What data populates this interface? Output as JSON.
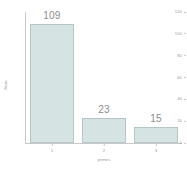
{
  "chart_data": {
    "type": "bar",
    "title": "",
    "categories": [
      "1",
      "2",
      "3"
    ],
    "values": [
      109,
      23,
      15
    ],
    "bar_labels": [
      "109",
      "23",
      "15"
    ],
    "xlabel": "primes",
    "ylabel": "Num",
    "ylim": [
      0,
      120
    ],
    "yticks": [
      0,
      20,
      40,
      60,
      80,
      100,
      120
    ],
    "ytick_labels": [
      "0",
      "20",
      "40",
      "60",
      "80",
      "100",
      "120"
    ],
    "xtick_labels": [
      "1",
      "2",
      "3"
    ],
    "grid": false,
    "legend": false,
    "legend_position": "none",
    "colors": {
      "bar_fill": "#d5e3e2",
      "bar_edge": "#b4c6c6",
      "axis": "#c9c9c9",
      "text": "#9a9a9a",
      "label_text": "#8d8d8d",
      "background": "#ffffff"
    }
  }
}
